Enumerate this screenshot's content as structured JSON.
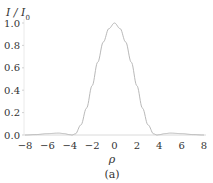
{
  "chart_data": {
    "type": "line",
    "title": "",
    "caption": "(a)",
    "xlabel": "ρ",
    "ylabel": "I / I0",
    "xlim": [
      -8,
      8
    ],
    "ylim": [
      0,
      1.0
    ],
    "xticks": [
      -8,
      -6,
      -4,
      -2,
      0,
      2,
      4,
      6,
      8
    ],
    "xtick_labels": [
      "−8",
      "−6",
      "−4",
      "−2",
      "0",
      "2",
      "4",
      "6",
      "8"
    ],
    "yticks": [
      0.0,
      0.2,
      0.4,
      0.6,
      0.8,
      1.0
    ],
    "ytick_labels": [
      "0.0",
      "0.2",
      "0.4",
      "0.6",
      "0.8",
      "1.0"
    ],
    "grid": false,
    "legend": null,
    "series": [
      {
        "name": "I/I0",
        "color": "#b0b0b0",
        "x": [
          -8,
          -7,
          -6,
          -5,
          -4.5,
          -4,
          -3.8,
          -3.5,
          -3,
          -2.5,
          -2,
          -1.5,
          -1,
          -0.5,
          0,
          0.5,
          1,
          1.5,
          2,
          2.5,
          3,
          3.5,
          3.8,
          4,
          4.5,
          5,
          6,
          7,
          8
        ],
        "y": [
          0.0,
          0.004,
          0.012,
          0.017,
          0.012,
          0.003,
          0.0,
          0.01,
          0.09,
          0.24,
          0.44,
          0.65,
          0.83,
          0.95,
          1.0,
          0.95,
          0.83,
          0.65,
          0.44,
          0.24,
          0.09,
          0.01,
          0.0,
          0.003,
          0.012,
          0.017,
          0.012,
          0.004,
          0.0
        ]
      }
    ]
  }
}
